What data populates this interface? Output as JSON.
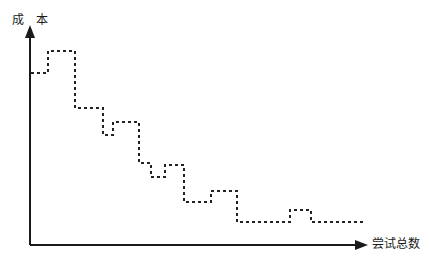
{
  "figure": {
    "title": "",
    "background_color": "#ffffff",
    "width": 429,
    "height": 267
  },
  "axes": {
    "y": {
      "label": "成 本",
      "color": "#1a1a1a",
      "origin_x": 30,
      "origin_y": 245,
      "tip_y": 25,
      "arrow": "up-arrow"
    },
    "x": {
      "label": "尝试总数",
      "color": "#1a1a1a",
      "origin_x": 30,
      "origin_y": 245,
      "tip_x": 368,
      "arrow": "right-arrow"
    }
  },
  "series": {
    "name": "cost-vs-attempts",
    "style": "dashed",
    "color": "#222222",
    "line_width": 2,
    "dash_pattern": "3 3"
  },
  "chart_data": {
    "type": "line",
    "title": "",
    "xlabel": "尝试总数",
    "ylabel": "成 本",
    "grid": false,
    "legend": null,
    "xlim": [
      0,
      368
    ],
    "ylim": [
      0,
      245
    ],
    "series": [
      {
        "name": "成本",
        "style": "dashed",
        "step": "post",
        "points": [
          [
            31,
            73
          ],
          [
            48,
            73
          ],
          [
            48,
            51
          ],
          [
            75,
            51
          ],
          [
            75,
            108
          ],
          [
            103,
            108
          ],
          [
            103,
            135
          ],
          [
            113,
            135
          ],
          [
            113,
            122
          ],
          [
            139,
            122
          ],
          [
            139,
            163
          ],
          [
            151,
            163
          ],
          [
            151,
            177
          ],
          [
            165,
            177
          ],
          [
            165,
            165
          ],
          [
            184,
            165
          ],
          [
            184,
            202
          ],
          [
            211,
            202
          ],
          [
            211,
            191
          ],
          [
            237,
            191
          ],
          [
            237,
            222
          ],
          [
            290,
            222
          ],
          [
            290,
            210
          ],
          [
            311,
            210
          ],
          [
            311,
            222
          ],
          [
            365,
            222
          ]
        ]
      }
    ]
  }
}
